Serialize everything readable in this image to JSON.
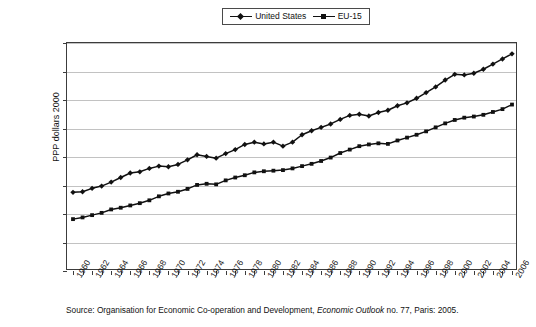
{
  "legend": {
    "entries": [
      {
        "label": "United States",
        "marker": "diamond",
        "color": "#111111"
      },
      {
        "label": "EU-15",
        "marker": "square",
        "color": "#111111"
      }
    ]
  },
  "axes": {
    "ylabel": "PPP dollars 2000",
    "yticks": [
      "0",
      "5,000",
      "10,000",
      "15,000",
      "20,000",
      "25,000",
      "30,000",
      "35,000",
      "40,000"
    ]
  },
  "source": {
    "prefix": "Source: Organisation for Economic Co-operation and Development, ",
    "italic": "Economic Outlook",
    "suffix": " no. 77, Paris: 2005."
  },
  "chart_data": {
    "type": "line",
    "title": "",
    "xlabel": "",
    "ylabel": "PPP dollars 2000",
    "ylim": [
      0,
      40000
    ],
    "ytick_step": 5000,
    "grid": true,
    "legend_position": "top-center",
    "x": [
      1960,
      1961,
      1962,
      1963,
      1964,
      1965,
      1966,
      1967,
      1968,
      1969,
      1970,
      1971,
      1972,
      1973,
      1974,
      1975,
      1976,
      1977,
      1978,
      1979,
      1980,
      1981,
      1982,
      1983,
      1984,
      1985,
      1986,
      1987,
      1988,
      1989,
      1990,
      1991,
      1992,
      1993,
      1994,
      1995,
      1996,
      1997,
      1998,
      1999,
      2000,
      2001,
      2002,
      2003,
      2004,
      2005,
      2006
    ],
    "xtick_labels": [
      "1960",
      "1962",
      "1964",
      "1966",
      "1968",
      "1970",
      "1972",
      "1974",
      "1976",
      "1978",
      "1980",
      "1982",
      "1984",
      "1986",
      "1988",
      "1990",
      "1992",
      "1994",
      "1996",
      "1998",
      "2000",
      "2002",
      "2004",
      "2006"
    ],
    "series": [
      {
        "name": "United States",
        "marker": "diamond",
        "color": "#111111",
        "values": [
          13800,
          13900,
          14500,
          14900,
          15600,
          16400,
          17200,
          17400,
          18000,
          18400,
          18300,
          18700,
          19500,
          20400,
          20100,
          19800,
          20600,
          21300,
          22200,
          22600,
          22300,
          22600,
          21900,
          22600,
          23900,
          24600,
          25200,
          25800,
          26600,
          27300,
          27500,
          27200,
          27800,
          28200,
          29000,
          29500,
          30300,
          31300,
          32300,
          33500,
          34500,
          34400,
          34700,
          35400,
          36300,
          37200,
          38100
        ]
      },
      {
        "name": "EU-15",
        "marker": "square",
        "color": "#111111",
        "values": [
          9100,
          9400,
          9800,
          10200,
          10800,
          11100,
          11500,
          11900,
          12400,
          13100,
          13600,
          13900,
          14400,
          15100,
          15300,
          15200,
          15900,
          16400,
          16800,
          17300,
          17500,
          17600,
          17700,
          18000,
          18400,
          18800,
          19300,
          19900,
          20700,
          21300,
          21900,
          22200,
          22400,
          22300,
          22900,
          23400,
          23900,
          24500,
          25200,
          25900,
          26500,
          26900,
          27100,
          27400,
          27900,
          28400,
          29200
        ]
      }
    ]
  }
}
